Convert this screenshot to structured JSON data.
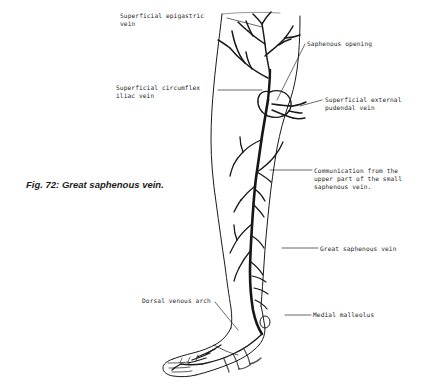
{
  "figure": {
    "caption": "Fig. 72: Great saphenous vein.",
    "background_color": "#ffffff",
    "ink_color": "#1a1a1a"
  },
  "labels": [
    {
      "id": "superficial-epigastric-vein",
      "text": "Superficial epigastric\nvein",
      "x": 120,
      "y": 12,
      "align": "left"
    },
    {
      "id": "saphenous-opening",
      "text": "Saphenous opening",
      "x": 307,
      "y": 40,
      "align": "left"
    },
    {
      "id": "superficial-circumflex-iliac-vein",
      "text": "Superficial circumflex\niliac vein",
      "x": 116,
      "y": 84,
      "align": "left"
    },
    {
      "id": "superficial-external-pudendal-vein",
      "text": "Superficial external\npudendal vein",
      "x": 325,
      "y": 96,
      "align": "left"
    },
    {
      "id": "communication-small-saphenous-vein",
      "text": "Communication from the\nupper part of the small\nsaphenous vein.",
      "x": 314,
      "y": 167,
      "align": "left"
    },
    {
      "id": "great-saphenous-vein",
      "text": "Great saphenous vein",
      "x": 320,
      "y": 245,
      "align": "left"
    },
    {
      "id": "dorsal-venous-arch",
      "text": "Dorsal venous arch",
      "x": 142,
      "y": 297,
      "align": "left"
    },
    {
      "id": "medial-malleolus",
      "text": "Medial malleolus",
      "x": 313,
      "y": 311,
      "align": "left"
    }
  ]
}
